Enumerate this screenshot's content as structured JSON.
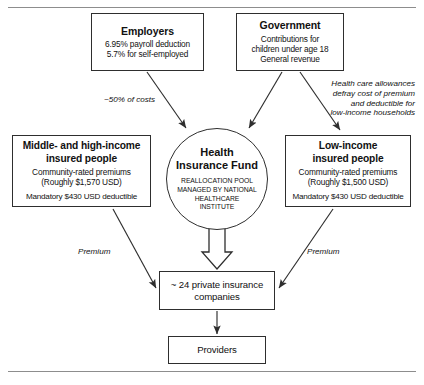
{
  "figure": {
    "colors": {
      "stroke": "#2e2e2e",
      "rule": "#8d8d8d",
      "background": "#ffffff",
      "text": "#111111"
    }
  },
  "nodes": {
    "employers": {
      "title": "Employers",
      "line1": "6.95% payroll deduction",
      "line2": "5.7% for self-employed"
    },
    "government": {
      "title": "Government",
      "line1": "Contributions for",
      "line2": "children under age 18",
      "line3": "General revenue"
    },
    "middle_high": {
      "title_line1": "Middle- and high-income",
      "title_line2": "insured people",
      "line1": "Community-rated premiums",
      "line2": "(Roughly $1,570 USD)",
      "line3": "Mandatory $430 USD deductible"
    },
    "low_income": {
      "title_line1": "Low-income",
      "title_line2": "insured people",
      "line1": "Community-rated premiums",
      "line2": "(Roughly $1,500 USD)",
      "line3": "Mandatory $430 USD deductible"
    },
    "fund": {
      "title_line1": "Health",
      "title_line2": "Insurance Fund",
      "caps_line1": "REALLOCATION POOL",
      "caps_line2": "MANAGED BY NATIONAL",
      "caps_line3": "HEALTHCARE",
      "caps_line4": "INSTITUTE"
    },
    "insurers": {
      "line1": "~ 24 private insurance",
      "line2": "companies"
    },
    "providers": {
      "title": "Providers"
    }
  },
  "edge_labels": {
    "employers_to_fund": "~50% of costs",
    "government_to_low_income": "Health care allowances\ndefray cost of premium\nand deductible for\nlow-income households",
    "premium_left": "Premium",
    "premium_right": "Premium"
  }
}
